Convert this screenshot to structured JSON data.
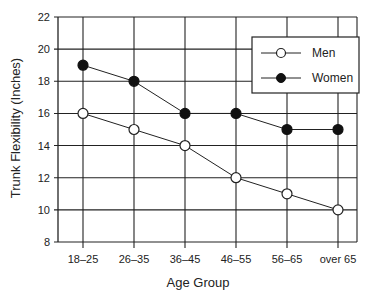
{
  "chart_data": {
    "type": "line",
    "title": "",
    "xlabel": "Age Group",
    "ylabel": "Trunk Flexibility (Inches)",
    "categories": [
      "18–25",
      "26–35",
      "36–45",
      "46–55",
      "56–65",
      "over 65"
    ],
    "series": [
      {
        "name": "Men",
        "marker": "open-circle",
        "values": [
          16,
          15,
          14,
          12,
          11,
          10
        ]
      },
      {
        "name": "Women",
        "marker": "filled-circle",
        "values": [
          19,
          18,
          16,
          16,
          15,
          15
        ]
      }
    ],
    "ylim": [
      8,
      22
    ],
    "yticks": [
      8,
      10,
      12,
      14,
      16,
      18,
      20,
      22
    ],
    "grid": true,
    "legend_position": "upper right"
  },
  "legend": {
    "men_label": "Men",
    "women_label": "Women"
  },
  "colors": {
    "line": "#222222",
    "background": "#ffffff"
  }
}
